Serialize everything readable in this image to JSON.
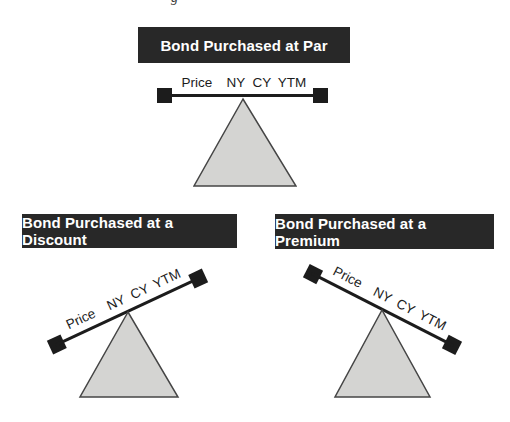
{
  "figure": {
    "cropped_caption_fragment": "g",
    "beam_labels": {
      "price": "Price",
      "ny": "NY",
      "cy": "CY",
      "ytm": "YTM"
    },
    "diagrams": {
      "par": {
        "title": "Bond Purchased at Par",
        "tilt_deg": 0
      },
      "discount": {
        "title": "Bond Purchased at a Discount",
        "tilt_deg": -25
      },
      "premium": {
        "title": "Bond Purchased at a Premium",
        "tilt_deg": 27
      }
    },
    "colors": {
      "background": "#ffffff",
      "header_bg": "#282828",
      "header_text": "#ffffff",
      "beam": "#1c1c1c",
      "weight_square": "#1c1c1c",
      "triangle_fill": "#d4d4d2",
      "triangle_stroke": "#454545",
      "label_text": "#1c1c1c"
    }
  }
}
